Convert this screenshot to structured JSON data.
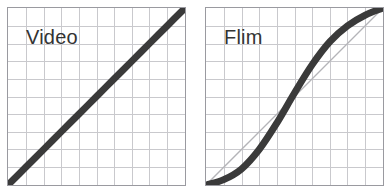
{
  "figure": {
    "background_color": "#ffffff",
    "panel_border_color": "#9a9aa0",
    "grid_color": "#c8c8cc",
    "curve_color": "#3a3a3a",
    "reference_line_color": "#b4b4b8",
    "label_color": "#333333"
  },
  "panels": [
    {
      "id": "video",
      "label": "Video",
      "grid_columns": 10,
      "grid_rows": 10,
      "has_reference_line": false
    },
    {
      "id": "flim",
      "label": "Flim",
      "grid_columns": 10,
      "grid_rows": 10,
      "has_reference_line": true
    }
  ],
  "chart_data": [
    {
      "type": "line",
      "title": "Video",
      "xlabel": "",
      "ylabel": "",
      "xlim": [
        0,
        1
      ],
      "ylim": [
        0,
        1
      ],
      "grid": true,
      "grid_columns": 10,
      "grid_rows": 10,
      "legend": "none",
      "series": [
        {
          "name": "Video transfer curve",
          "style": "thick-solid",
          "color": "#3a3a3a",
          "x": [
            0.0,
            0.1,
            0.2,
            0.3,
            0.4,
            0.5,
            0.6,
            0.7,
            0.8,
            0.9,
            1.0
          ],
          "values": [
            0.0,
            0.1,
            0.2,
            0.3,
            0.4,
            0.5,
            0.6,
            0.7,
            0.8,
            0.9,
            1.0
          ]
        }
      ]
    },
    {
      "type": "line",
      "title": "Flim",
      "xlabel": "",
      "ylabel": "",
      "xlim": [
        0,
        1
      ],
      "ylim": [
        0,
        1
      ],
      "grid": true,
      "grid_columns": 10,
      "grid_rows": 10,
      "legend": "none",
      "series": [
        {
          "name": "Flim transfer curve",
          "style": "thick-solid",
          "color": "#3a3a3a",
          "x": [
            0.0,
            0.1,
            0.2,
            0.3,
            0.4,
            0.5,
            0.6,
            0.7,
            0.8,
            0.9,
            1.0
          ],
          "values": [
            0.0,
            0.03,
            0.09,
            0.2,
            0.35,
            0.52,
            0.68,
            0.81,
            0.9,
            0.96,
            1.0
          ]
        },
        {
          "name": "Linear reference",
          "style": "thin-solid",
          "color": "#b4b4b8",
          "x": [
            0.0,
            1.0
          ],
          "values": [
            0.0,
            1.0
          ]
        }
      ]
    }
  ]
}
